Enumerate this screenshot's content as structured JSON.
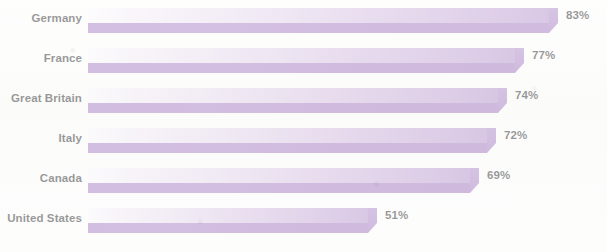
{
  "chart_data": {
    "type": "bar",
    "orientation": "horizontal",
    "title": "",
    "subtitle": "",
    "xlabel": "",
    "ylabel": "",
    "categories": [
      "Germany",
      "France",
      "Great Britain",
      "Italy",
      "Canada",
      "United States"
    ],
    "values": [
      83,
      77,
      74,
      72,
      69,
      51
    ],
    "value_labels": [
      "83%",
      "77%",
      "74%",
      "72%",
      "69%",
      "51%"
    ],
    "value_suffix": "%",
    "xlim": [
      0,
      100
    ],
    "grid": false,
    "legend": null,
    "legend_position": "none",
    "annotations": [],
    "series": [
      {
        "name": "",
        "values": [
          83,
          77,
          74,
          72,
          69,
          51
        ]
      }
    ]
  },
  "style": {
    "background_color": "#fdfdfc",
    "bar_fill_light_start": "#fbf9fc",
    "bar_fill_light_end": "#ab84c6",
    "bar_fill_dark": "#9c6dbd",
    "bar_bevel_color": "#a77fc7",
    "label_color": "#1a1a1a",
    "value_color": "#1a1a1a"
  },
  "layout": {
    "bar_origin_x": 88,
    "px_per_percent": 5.66,
    "row_tops": [
      8,
      48,
      88,
      128,
      168,
      208
    ],
    "bar_height_total": 25,
    "bar_height_light": 15,
    "bar_height_dark": 10
  }
}
